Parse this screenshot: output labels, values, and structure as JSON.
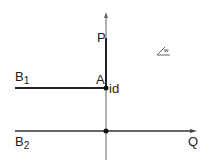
{
  "labels": {
    "p": "P",
    "a": "A",
    "id": "id",
    "b1_main": "B",
    "b1_sub": "1",
    "b2_main": "B",
    "b2_sub": "2",
    "q": "Q",
    "angle_sub": "w"
  },
  "colors": {
    "line": "#222222",
    "thin": "#555555"
  }
}
